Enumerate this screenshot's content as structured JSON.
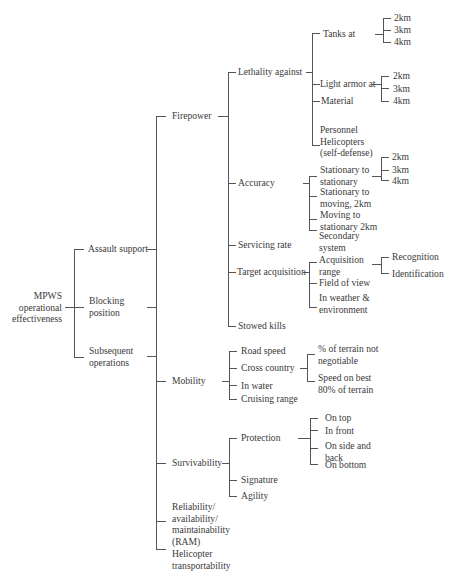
{
  "diagram": {
    "title": "MPWS operational effectiveness",
    "root": {
      "label": "MPWS\noperational\neffectiveness"
    },
    "missions": [
      {
        "label": "Assault support"
      },
      {
        "label": "Blocking\nposition"
      },
      {
        "label": "Subsequent\noperations"
      }
    ],
    "criteria": [
      {
        "label": "Firepower",
        "children": [
          {
            "label": "Lethality against",
            "children": [
              {
                "label": "Tanks at",
                "ranges": [
                  "2km",
                  "3km",
                  "4km"
                ]
              },
              {
                "label": "Light armor at",
                "ranges": [
                  "2km",
                  "3km",
                  "4km"
                ]
              },
              {
                "label": "Material"
              },
              {
                "label": "Personnel\nHelicopters\n(self-defense)"
              }
            ]
          },
          {
            "label": "Accuracy",
            "children": [
              {
                "label": "Stationary to\nstationary",
                "ranges": [
                  "2km",
                  "3km",
                  "4km"
                ]
              },
              {
                "label": "Stationary to\nmoving, 2km"
              },
              {
                "label": "Moving to\nstationary 2km"
              },
              {
                "label": "Secondary\nsystem"
              }
            ]
          },
          {
            "label": "Servicing rate"
          },
          {
            "label": "Target acquisition",
            "children": [
              {
                "label": "Acquisition\nrange",
                "children": [
                  "Recognition",
                  "Identification"
                ]
              },
              {
                "label": "Field of view"
              },
              {
                "label": "In weather &\nenvironment"
              }
            ]
          },
          {
            "label": "Stowed kills"
          }
        ]
      },
      {
        "label": "Mobility",
        "children": [
          {
            "label": "Road speed"
          },
          {
            "label": "Cross country",
            "children": [
              "% of terrain not\nnegotiable",
              "Speed on best\n80% of terrain"
            ]
          },
          {
            "label": "In water"
          },
          {
            "label": "Cruising range"
          }
        ]
      },
      {
        "label": "Survivability",
        "children": [
          {
            "label": "Protection",
            "children": [
              "On top",
              "In front",
              "On side and\nback",
              "On bottom"
            ]
          },
          {
            "label": "Signature"
          },
          {
            "label": "Agility"
          }
        ]
      },
      {
        "label": "Reliability/\navailability/\nmaintainability\n(RAM)"
      },
      {
        "label": "Helicopter\ntransportability"
      }
    ],
    "colors": {
      "line": "#555555",
      "text": "#3a3a3a",
      "background": "#ffffff"
    }
  }
}
